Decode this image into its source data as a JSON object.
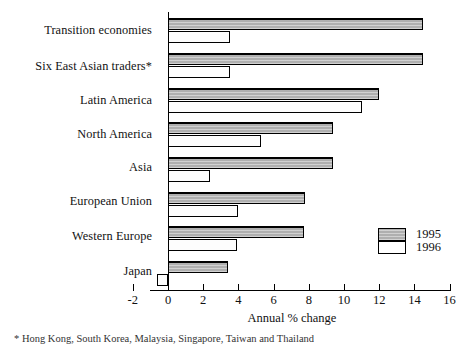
{
  "chart_data": {
    "type": "bar",
    "orientation": "horizontal",
    "title": "",
    "subtitle": "",
    "xlabel": "Annual % change",
    "ylabel": "",
    "xlim": [
      -2,
      16
    ],
    "xticks": [
      -2,
      0,
      2,
      4,
      6,
      8,
      10,
      12,
      14,
      16
    ],
    "xticklabels": [
      "-2",
      "0",
      "2",
      "4",
      "6",
      "8",
      "10",
      "12",
      "14",
      "16"
    ],
    "grid": false,
    "legend_position": "lower-right",
    "categories": [
      "Transition economies",
      "Six East Asian traders*",
      "Latin America",
      "North America",
      "Asia",
      "European Union",
      "Western Europe",
      "Japan"
    ],
    "series": [
      {
        "name": "1995",
        "color": "#b8b8b8",
        "values": [
          14.5,
          14.5,
          12.0,
          9.4,
          9.4,
          7.8,
          7.7,
          3.4
        ]
      },
      {
        "name": "1996",
        "color": "#ffffff",
        "values": [
          3.5,
          3.5,
          11.0,
          5.3,
          2.4,
          4.0,
          3.9,
          -0.6
        ]
      }
    ],
    "annotations": []
  },
  "legend": {
    "entries": [
      {
        "label": "1995",
        "swatch": "gray-hatched"
      },
      {
        "label": "1996",
        "swatch": "white"
      }
    ]
  },
  "axis": {
    "x_title": "Annual % change"
  },
  "footnote": {
    "text": "* Hong Kong, South Korea, Malaysia, Singapore, Taiwan and Thailand"
  }
}
